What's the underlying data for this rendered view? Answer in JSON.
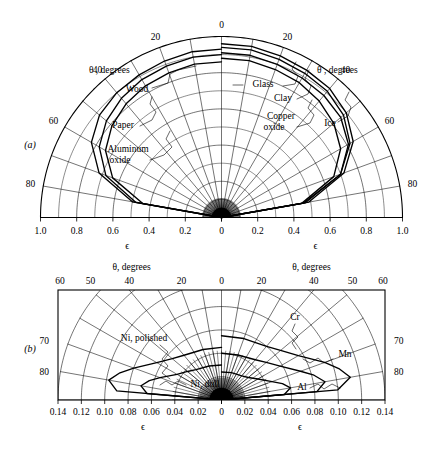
{
  "figure": {
    "type": "two-panel polar emissivity diagram",
    "background": "#ffffff",
    "ink": "#000000"
  },
  "panels": [
    {
      "letter": "(a)",
      "name": "nonconductors",
      "theta_axis_title_left": "θ , degrees",
      "theta_axis_title_right": "θ , degrees",
      "eps_axis_title_left": "ϵ",
      "eps_axis_title_right": "ϵ",
      "theta_ticks_left": [
        "0",
        "20",
        "40",
        "60",
        "80"
      ],
      "theta_ticks_right": [
        "0",
        "20",
        "40",
        "60",
        "80"
      ],
      "eps_ticks_left": [
        "1.0",
        "0.8",
        "0.6",
        "0.4",
        "0.2",
        "0"
      ],
      "eps_ticks_right": [
        "0",
        "0.2",
        "0.4",
        "0.6",
        "0.8",
        "1.0"
      ],
      "labels": [
        {
          "text": "Wood",
          "side": "left"
        },
        {
          "text": "Paper",
          "side": "left"
        },
        {
          "text": "Aluminum",
          "side": "left"
        },
        {
          "text": "oxide",
          "side": "left"
        },
        {
          "text": "Glass",
          "side": "right"
        },
        {
          "text": "Clay",
          "side": "right"
        },
        {
          "text": "Copper",
          "side": "right"
        },
        {
          "text": "oxide",
          "side": "right"
        },
        {
          "text": "Ice",
          "side": "right"
        }
      ]
    },
    {
      "letter": "(b)",
      "name": "conductors",
      "theta_axis_title_left": "θ, degrees",
      "theta_axis_title_right": "θ, degrees",
      "eps_axis_title_left": "ϵ",
      "eps_axis_title_right": "ϵ",
      "theta_ticks_top_left": [
        "60",
        "50",
        "40",
        "20",
        "0"
      ],
      "theta_ticks_top_right": [
        "20",
        "40",
        "50",
        "60"
      ],
      "theta_ticks_side_left": [
        "70",
        "80"
      ],
      "theta_ticks_side_right": [
        "70",
        "80"
      ],
      "eps_ticks_left": [
        "0.14",
        "0.12",
        "0.10",
        "0.08",
        "0.06",
        "0.04",
        "0.02",
        "0"
      ],
      "eps_ticks_right": [
        "0.02",
        "0.04",
        "0.06",
        "0.08",
        "0.10",
        "0.12",
        "0.14"
      ],
      "labels": [
        {
          "text": "Ni, polished",
          "side": "left"
        },
        {
          "text": "Ni, dull",
          "side": "left"
        },
        {
          "text": "Cr",
          "side": "right"
        },
        {
          "text": "Mn",
          "side": "right"
        },
        {
          "text": "Al",
          "side": "right"
        }
      ]
    }
  ],
  "chart_data": {
    "type": "line",
    "title": "",
    "subtitle": "",
    "xlabel": "ϵ",
    "ylabel": "θ, degrees",
    "grid": true,
    "legend": "inline-annotations",
    "panels": [
      {
        "id": "a",
        "letter": "(a)",
        "coordinate_system": "polar",
        "theta_label": "θ , degrees",
        "theta_unit": "degrees",
        "theta_range": [
          0,
          90
        ],
        "theta_ticks": [
          0,
          20,
          40,
          60,
          80
        ],
        "r_label": "ϵ",
        "r_range": [
          0,
          1.0
        ],
        "r_ticks": [
          0,
          0.2,
          0.4,
          0.6,
          0.8,
          1.0
        ],
        "xaxis_tick_labels": [
          "1.0",
          "0.8",
          "0.6",
          "0.4",
          "0.2",
          "0",
          "0.2",
          "0.4",
          "0.6",
          "0.8",
          "1.0"
        ],
        "series": [
          {
            "name": "Wood",
            "side": "left",
            "theta": [
              0,
              10,
              20,
              30,
              40,
              50,
              60,
              70,
              80,
              90
            ],
            "eps": [
              0.9,
              0.9,
              0.89,
              0.88,
              0.86,
              0.83,
              0.78,
              0.68,
              0.48,
              0.0
            ]
          },
          {
            "name": "Paper",
            "side": "left",
            "theta": [
              0,
              10,
              20,
              30,
              40,
              50,
              60,
              70,
              80,
              90
            ],
            "eps": [
              0.93,
              0.93,
              0.92,
              0.91,
              0.9,
              0.88,
              0.83,
              0.72,
              0.5,
              0.0
            ]
          },
          {
            "name": "Aluminum oxide",
            "side": "left",
            "theta": [
              0,
              10,
              20,
              30,
              40,
              50,
              60,
              70,
              80,
              90
            ],
            "eps": [
              0.86,
              0.86,
              0.85,
              0.84,
              0.82,
              0.79,
              0.74,
              0.64,
              0.44,
              0.0
            ]
          },
          {
            "name": "Glass",
            "side": "right",
            "theta": [
              0,
              10,
              20,
              30,
              40,
              50,
              60,
              70,
              80,
              90
            ],
            "eps": [
              0.94,
              0.94,
              0.93,
              0.92,
              0.91,
              0.88,
              0.82,
              0.7,
              0.46,
              0.0
            ]
          },
          {
            "name": "Clay",
            "side": "right",
            "theta": [
              0,
              10,
              20,
              30,
              40,
              50,
              60,
              70,
              80,
              90
            ],
            "eps": [
              0.91,
              0.91,
              0.9,
              0.89,
              0.88,
              0.86,
              0.81,
              0.7,
              0.47,
              0.0
            ]
          },
          {
            "name": "Copper oxide",
            "side": "right",
            "theta": [
              0,
              10,
              20,
              30,
              40,
              50,
              60,
              70,
              80,
              90
            ],
            "eps": [
              0.88,
              0.88,
              0.87,
              0.86,
              0.84,
              0.81,
              0.76,
              0.66,
              0.45,
              0.0
            ]
          },
          {
            "name": "Ice",
            "side": "right",
            "theta": [
              0,
              10,
              20,
              30,
              40,
              50,
              60,
              70,
              80,
              90
            ],
            "eps": [
              0.96,
              0.96,
              0.95,
              0.94,
              0.93,
              0.9,
              0.84,
              0.72,
              0.49,
              0.0
            ]
          }
        ]
      },
      {
        "id": "b",
        "letter": "(b)",
        "coordinate_system": "polar",
        "theta_label": "θ, degrees",
        "theta_unit": "degrees",
        "theta_range": [
          0,
          90
        ],
        "theta_ticks": [
          0,
          20,
          40,
          50,
          60,
          70,
          80
        ],
        "r_label": "ϵ",
        "r_range": [
          0,
          0.14
        ],
        "r_ticks": [
          0,
          0.02,
          0.04,
          0.06,
          0.08,
          0.1,
          0.12,
          0.14
        ],
        "xaxis_tick_labels": [
          "0.14",
          "0.12",
          "0.10",
          "0.08",
          "0.06",
          "0.04",
          "0.02",
          "0",
          "0.02",
          "0.04",
          "0.06",
          "0.08",
          "0.10",
          "0.12",
          "0.14"
        ],
        "series": [
          {
            "name": "Ni, polished",
            "side": "left",
            "theta": [
              0,
              20,
              40,
              50,
              60,
              70,
              75,
              80,
              85,
              90
            ],
            "eps": [
              0.045,
              0.046,
              0.05,
              0.055,
              0.064,
              0.08,
              0.09,
              0.098,
              0.09,
              0.0
            ]
          },
          {
            "name": "Ni, dull",
            "side": "left",
            "theta": [
              0,
              20,
              40,
              50,
              60,
              70,
              75,
              80,
              85,
              90
            ],
            "eps": [
              0.03,
              0.031,
              0.034,
              0.038,
              0.044,
              0.056,
              0.064,
              0.07,
              0.064,
              0.0
            ]
          },
          {
            "name": "Cr",
            "side": "right",
            "theta": [
              0,
              20,
              40,
              50,
              60,
              70,
              75,
              80,
              85,
              90
            ],
            "eps": [
              0.055,
              0.056,
              0.06,
              0.066,
              0.076,
              0.094,
              0.104,
              0.112,
              0.1,
              0.0
            ]
          },
          {
            "name": "Mn",
            "side": "right",
            "theta": [
              0,
              20,
              40,
              50,
              60,
              70,
              75,
              80,
              85,
              90
            ],
            "eps": [
              0.04,
              0.041,
              0.045,
              0.05,
              0.058,
              0.072,
              0.082,
              0.09,
              0.082,
              0.0
            ]
          },
          {
            "name": "Al",
            "side": "right",
            "theta": [
              0,
              20,
              40,
              50,
              60,
              70,
              75,
              80,
              85,
              90
            ],
            "eps": [
              0.024,
              0.025,
              0.027,
              0.03,
              0.036,
              0.046,
              0.054,
              0.06,
              0.054,
              0.0
            ]
          }
        ]
      }
    ]
  }
}
